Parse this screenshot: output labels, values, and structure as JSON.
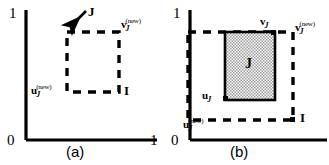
{
  "figure": {
    "title": "",
    "panels": [
      {
        "id": "a",
        "caption": "(a)",
        "axis": {
          "origin_label": "0",
          "y_top_label": "1",
          "x_right_label": "1"
        },
        "shapes": [
          {
            "name": "dashed-square-J",
            "style": "dashed",
            "fill": "none"
          }
        ],
        "labels": {
          "arrow_label": "J",
          "corner_top_right": {
            "base": "v",
            "sub": "J",
            "sup": "(new)"
          },
          "corner_bottom_left": {
            "base": "u",
            "sub": "J",
            "sup": "(new)"
          },
          "corner_bottom_right": "I"
        }
      },
      {
        "id": "b",
        "caption": "(b)",
        "axis": {
          "origin_label": "0",
          "y_top_label": "1",
          "x_right_label": ""
        },
        "shapes": [
          {
            "name": "shaded-rect-J",
            "style": "solid",
            "fill": "stipple-gray"
          },
          {
            "name": "dashed-rect-I",
            "style": "dashed",
            "fill": "none"
          }
        ],
        "labels": {
          "region_label": "J",
          "shaded_top_right": {
            "base": "v",
            "sub": "J",
            "sup": ""
          },
          "shaded_bottom_left": {
            "base": "u",
            "sub": "J",
            "sup": ""
          },
          "dashed_top_right": {
            "base": "v",
            "sub": "J",
            "sup": "(new)"
          },
          "dashed_bottom_left": {
            "base": "u",
            "sub": "J",
            "sup": "(new)"
          },
          "dashed_bottom_right": "I"
        }
      }
    ],
    "colors": {
      "ink": "#000000",
      "background": "#ffffff",
      "shade_fill": "#c8c8c8"
    }
  }
}
